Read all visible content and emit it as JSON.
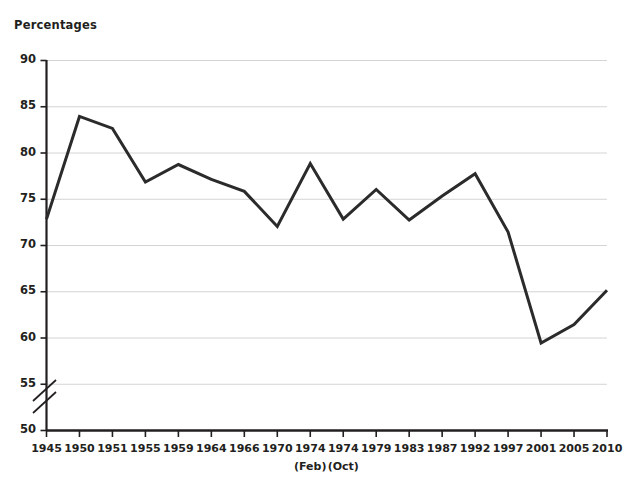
{
  "chart_data": {
    "type": "line",
    "title": "",
    "ylabel": "Percentages",
    "xlabel": "",
    "ylim": [
      50,
      90
    ],
    "ytick_values": [
      50,
      55,
      60,
      65,
      70,
      75,
      80,
      85,
      90
    ],
    "ytick_labels": [
      "50",
      "55",
      "60",
      "65",
      "70",
      "75",
      "80",
      "85",
      "90"
    ],
    "axis_break": {
      "present": true,
      "between": [
        50,
        55
      ],
      "style": "double-slash"
    },
    "grid": "horizontal",
    "legend": "none",
    "categories": [
      "1945",
      "1950",
      "1951",
      "1955",
      "1959",
      "1964",
      "1966",
      "1970",
      "1974",
      "1974",
      "1979",
      "1983",
      "1987",
      "1992",
      "1997",
      "2001",
      "2005",
      "2010"
    ],
    "sub_labels": [
      {
        "index": 8,
        "text": "(Feb)"
      },
      {
        "index": 9,
        "text": "(Oct)"
      }
    ],
    "series": [
      {
        "name": "Turnout",
        "color": "#2b2b2b",
        "values": [
          72.8,
          83.9,
          82.6,
          76.8,
          78.7,
          77.1,
          75.8,
          72.0,
          78.8,
          72.8,
          76.0,
          72.7,
          75.3,
          77.7,
          71.4,
          59.4,
          61.4,
          65.1
        ]
      }
    ]
  },
  "icons": {
    "axis_break": "axis-break-icon"
  }
}
